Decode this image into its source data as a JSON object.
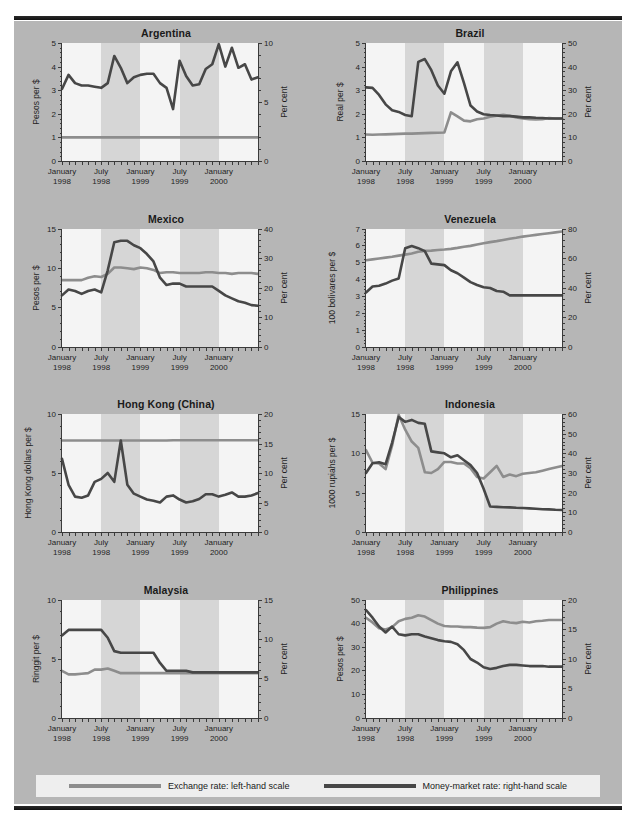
{
  "legend": {
    "exchange": {
      "label": "Exchange rate: left-hand scale",
      "color": "#8d8d8d"
    },
    "money": {
      "label": "Money-market rate: right-hand scale",
      "color": "#474747"
    }
  },
  "x_axis": {
    "tick_labels": [
      {
        "line1": "January",
        "line2": "1998",
        "pos": 0.0
      },
      {
        "line1": "July",
        "line2": "1998",
        "pos": 0.2
      },
      {
        "line1": "January",
        "line2": "1999",
        "pos": 0.4
      },
      {
        "line1": "July",
        "line2": "1999",
        "pos": 0.6
      },
      {
        "line1": "January",
        "line2": "2000",
        "pos": 0.8
      }
    ],
    "minor_ticks": 30,
    "shaded_bands": [
      [
        0.2,
        0.4
      ],
      [
        0.6,
        0.8
      ]
    ],
    "range": "January 1998 - July 2000"
  },
  "chart_data": [
    {
      "type": "line",
      "title": "Argentina",
      "ylabel": "Pesos per $",
      "ylabel_right": "Per cent",
      "ylim": [
        0,
        5
      ],
      "yticks": [
        0,
        1,
        2,
        3,
        4,
        5
      ],
      "ylim_right": [
        0,
        10
      ],
      "yticks_right": [
        0,
        5,
        10
      ],
      "x": [
        "Jan-98",
        "Feb-98",
        "Mar-98",
        "Apr-98",
        "May-98",
        "Jun-98",
        "Jul-98",
        "Aug-98",
        "Sep-98",
        "Oct-98",
        "Nov-98",
        "Dec-98",
        "Jan-99",
        "Feb-99",
        "Mar-99",
        "Apr-99",
        "May-99",
        "Jun-99",
        "Jul-99",
        "Aug-99",
        "Sep-99",
        "Oct-99",
        "Nov-99",
        "Dec-99",
        "Jan-00",
        "Feb-00",
        "Mar-00",
        "Apr-00",
        "May-00",
        "Jun-00",
        "Jul-00"
      ],
      "series": [
        {
          "name": "Exchange rate",
          "scale": "left",
          "values": [
            1,
            1,
            1,
            1,
            1,
            1,
            1,
            1,
            1,
            1,
            1,
            1,
            1,
            1,
            1,
            1,
            1,
            1,
            1,
            1,
            1,
            1,
            1,
            1,
            1,
            1,
            1,
            1,
            1,
            1,
            1
          ]
        },
        {
          "name": "Money-market rate",
          "scale": "right",
          "values": [
            6.1,
            7.3,
            6.6,
            6.4,
            6.4,
            6.3,
            6.2,
            6.6,
            8.9,
            7.9,
            6.6,
            7.1,
            7.3,
            7.4,
            7.4,
            6.6,
            6.2,
            4.4,
            8.5,
            7.2,
            6.4,
            6.5,
            7.8,
            8.2,
            9.9,
            8.0,
            9.6,
            7.9,
            8.2,
            6.9,
            7.1
          ]
        }
      ]
    },
    {
      "type": "line",
      "title": "Brazil",
      "ylabel": "Real per $",
      "ylabel_right": "Per cent",
      "ylim": [
        0,
        5
      ],
      "yticks": [
        0,
        1,
        2,
        3,
        4,
        5
      ],
      "ylim_right": [
        0,
        50
      ],
      "yticks_right": [
        0,
        10,
        20,
        30,
        40,
        50
      ],
      "x": [
        "Jan-98",
        "Feb-98",
        "Mar-98",
        "Apr-98",
        "May-98",
        "Jun-98",
        "Jul-98",
        "Aug-98",
        "Sep-98",
        "Oct-98",
        "Nov-98",
        "Dec-98",
        "Jan-99",
        "Feb-99",
        "Mar-99",
        "Apr-99",
        "May-99",
        "Jun-99",
        "Jul-99",
        "Aug-99",
        "Sep-99",
        "Oct-99",
        "Nov-99",
        "Dec-99",
        "Jan-00",
        "Feb-00",
        "Mar-00",
        "Apr-00",
        "May-00",
        "Jun-00",
        "Jul-00"
      ],
      "series": [
        {
          "name": "Exchange rate",
          "scale": "left",
          "values": [
            1.12,
            1.11,
            1.12,
            1.13,
            1.14,
            1.15,
            1.16,
            1.16,
            1.17,
            1.18,
            1.19,
            1.2,
            1.21,
            2.06,
            1.89,
            1.71,
            1.68,
            1.77,
            1.8,
            1.88,
            1.92,
            1.96,
            1.92,
            1.84,
            1.8,
            1.77,
            1.76,
            1.77,
            1.82,
            1.8,
            1.8
          ]
        },
        {
          "name": "Money-market rate",
          "scale": "right",
          "values": [
            31.2,
            31.0,
            28.0,
            24.0,
            21.5,
            20.8,
            19.5,
            19.0,
            42.0,
            43.2,
            38.5,
            32.0,
            28.5,
            38.0,
            41.8,
            33.0,
            23.5,
            21.0,
            19.8,
            19.5,
            19.3,
            19.0,
            19.0,
            18.8,
            18.5,
            18.5,
            18.3,
            18.2,
            18.0,
            18.0,
            18.0
          ]
        }
      ]
    },
    {
      "type": "line",
      "title": "Mexico",
      "ylabel": "Pesos per $",
      "ylabel_right": "Per cent",
      "ylim": [
        0,
        15
      ],
      "yticks": [
        0,
        5,
        10,
        15
      ],
      "ylim_right": [
        0,
        40
      ],
      "yticks_right": [
        0,
        10,
        20,
        30,
        40
      ],
      "x": [
        "Jan-98",
        "Feb-98",
        "Mar-98",
        "Apr-98",
        "May-98",
        "Jun-98",
        "Jul-98",
        "Aug-98",
        "Sep-98",
        "Oct-98",
        "Nov-98",
        "Dec-98",
        "Jan-99",
        "Feb-99",
        "Mar-99",
        "Apr-99",
        "May-99",
        "Jun-99",
        "Jul-99",
        "Aug-99",
        "Sep-99",
        "Oct-99",
        "Nov-99",
        "Dec-99",
        "Jan-00",
        "Feb-00",
        "Mar-00",
        "Apr-00",
        "May-00",
        "Jun-00",
        "Jul-00"
      ],
      "series": [
        {
          "name": "Exchange rate",
          "scale": "left",
          "values": [
            8.5,
            8.5,
            8.5,
            8.5,
            8.8,
            9.0,
            8.9,
            9.3,
            10.1,
            10.1,
            10.0,
            9.9,
            10.1,
            10.0,
            9.8,
            9.4,
            9.5,
            9.5,
            9.4,
            9.4,
            9.4,
            9.4,
            9.5,
            9.5,
            9.4,
            9.4,
            9.3,
            9.4,
            9.4,
            9.4,
            9.3
          ]
        },
        {
          "name": "Money-market rate",
          "scale": "right",
          "values": [
            17.5,
            19.5,
            19.0,
            18.0,
            19.0,
            19.5,
            18.5,
            26.0,
            35.5,
            36.0,
            36.0,
            34.5,
            33.5,
            31.5,
            29.0,
            23.5,
            21.0,
            21.5,
            21.5,
            20.5,
            20.5,
            20.5,
            20.5,
            20.5,
            19.0,
            17.5,
            16.5,
            15.5,
            15.0,
            14.2,
            14.0
          ]
        }
      ]
    },
    {
      "type": "line",
      "title": "Venezuela",
      "ylabel": "100 bolivares per $",
      "ylabel_right": "Per cent",
      "ylim": [
        0,
        7
      ],
      "yticks": [
        0,
        1,
        2,
        3,
        4,
        5,
        6,
        7
      ],
      "ylim_right": [
        0,
        80
      ],
      "yticks_right": [
        0,
        20,
        40,
        60,
        80
      ],
      "x": [
        "Jan-98",
        "Feb-98",
        "Mar-98",
        "Apr-98",
        "May-98",
        "Jun-98",
        "Jul-98",
        "Aug-98",
        "Sep-98",
        "Oct-98",
        "Nov-98",
        "Dec-98",
        "Jan-99",
        "Feb-99",
        "Mar-99",
        "Apr-99",
        "May-99",
        "Jun-99",
        "Jul-99",
        "Aug-99",
        "Sep-99",
        "Oct-99",
        "Nov-99",
        "Dec-99",
        "Jan-00",
        "Feb-00",
        "Mar-00",
        "Apr-00",
        "May-00",
        "Jun-00",
        "Jul-00"
      ],
      "series": [
        {
          "name": "Exchange rate",
          "scale": "left",
          "values": [
            5.15,
            5.2,
            5.25,
            5.3,
            5.35,
            5.42,
            5.48,
            5.55,
            5.65,
            5.7,
            5.72,
            5.75,
            5.78,
            5.82,
            5.88,
            5.95,
            6.0,
            6.08,
            6.15,
            6.22,
            6.28,
            6.35,
            6.42,
            6.48,
            6.55,
            6.6,
            6.65,
            6.7,
            6.75,
            6.8,
            6.85
          ]
        },
        {
          "name": "Money-market rate",
          "scale": "right",
          "values": [
            37.0,
            41.0,
            41.5,
            43.0,
            45.0,
            46.5,
            67.0,
            68.5,
            67.0,
            65.0,
            56.5,
            56.0,
            55.5,
            52.0,
            50.0,
            47.0,
            44.0,
            42.0,
            40.5,
            40.0,
            38.0,
            37.5,
            35.0,
            35.0,
            35.0,
            35.0,
            35.0,
            35.0,
            35.0,
            35.0,
            35.0
          ]
        }
      ]
    },
    {
      "type": "line",
      "title": "Hong Kong (China)",
      "ylabel": "Hong Kong dollars per $",
      "ylabel_right": "Per cent",
      "ylim": [
        0,
        10
      ],
      "yticks": [
        0,
        5,
        10
      ],
      "ylim_right": [
        0,
        20
      ],
      "yticks_right": [
        0,
        5,
        10,
        15,
        20
      ],
      "x": [
        "Jan-98",
        "Feb-98",
        "Mar-98",
        "Apr-98",
        "May-98",
        "Jun-98",
        "Jul-98",
        "Aug-98",
        "Sep-98",
        "Oct-98",
        "Nov-98",
        "Dec-98",
        "Jan-99",
        "Feb-99",
        "Mar-99",
        "Apr-99",
        "May-99",
        "Jun-99",
        "Jul-99",
        "Aug-99",
        "Sep-99",
        "Oct-99",
        "Nov-99",
        "Dec-99",
        "Jan-00",
        "Feb-00",
        "Mar-00",
        "Apr-00",
        "May-00",
        "Jun-00",
        "Jul-00"
      ],
      "series": [
        {
          "name": "Exchange rate",
          "scale": "left",
          "values": [
            7.75,
            7.75,
            7.75,
            7.75,
            7.75,
            7.75,
            7.75,
            7.75,
            7.75,
            7.75,
            7.75,
            7.75,
            7.75,
            7.75,
            7.75,
            7.75,
            7.75,
            7.78,
            7.78,
            7.78,
            7.78,
            7.78,
            7.78,
            7.78,
            7.78,
            7.78,
            7.78,
            7.78,
            7.78,
            7.78,
            7.78
          ]
        },
        {
          "name": "Money-market rate",
          "scale": "right",
          "values": [
            12.4,
            8.0,
            6.0,
            5.8,
            6.2,
            8.5,
            9.0,
            10.0,
            8.5,
            15.5,
            8.0,
            6.5,
            6.0,
            5.5,
            5.3,
            5.0,
            6.0,
            6.2,
            5.5,
            5.0,
            5.2,
            5.6,
            6.4,
            6.4,
            6.0,
            6.3,
            6.7,
            6.0,
            6.0,
            6.2,
            6.6
          ]
        }
      ]
    },
    {
      "type": "line",
      "title": "Indonesia",
      "ylabel": "1000 rupiahs per $",
      "ylabel_right": "Per cent",
      "ylim": [
        0,
        15
      ],
      "yticks": [
        0,
        5,
        10,
        15
      ],
      "ylim_right": [
        0,
        60
      ],
      "yticks_right": [
        0,
        10,
        20,
        30,
        40,
        50,
        60
      ],
      "x": [
        "Jan-98",
        "Feb-98",
        "Mar-98",
        "Apr-98",
        "May-98",
        "Jun-98",
        "Jul-98",
        "Aug-98",
        "Sep-98",
        "Oct-98",
        "Nov-98",
        "Dec-98",
        "Jan-99",
        "Feb-99",
        "Mar-99",
        "Apr-99",
        "May-99",
        "Jun-99",
        "Jul-99",
        "Aug-99",
        "Sep-99",
        "Oct-99",
        "Nov-99",
        "Dec-99",
        "Jan-00",
        "Feb-00",
        "Mar-00",
        "Apr-00",
        "May-00",
        "Jun-00",
        "Jul-00"
      ],
      "series": [
        {
          "name": "Exchange rate",
          "scale": "left",
          "values": [
            10.4,
            8.8,
            8.7,
            8.0,
            11.0,
            14.9,
            13.0,
            11.5,
            10.7,
            7.6,
            7.5,
            8.0,
            8.9,
            8.9,
            8.7,
            8.7,
            8.1,
            7.0,
            6.8,
            7.6,
            8.4,
            7.0,
            7.3,
            7.1,
            7.4,
            7.5,
            7.6,
            7.8,
            8.0,
            8.2,
            8.4
          ]
        },
        {
          "name": "Money-market rate",
          "scale": "right",
          "values": [
            30.0,
            35.0,
            35.5,
            34.5,
            45.5,
            58.5,
            56.0,
            57.0,
            55.5,
            55.0,
            41.0,
            40.5,
            40.0,
            38.0,
            39.0,
            36.5,
            34.0,
            30.0,
            22.0,
            13.0,
            12.8,
            12.6,
            12.5,
            12.3,
            12.2,
            12.0,
            11.8,
            11.6,
            11.5,
            11.3,
            11.2
          ]
        }
      ]
    },
    {
      "type": "line",
      "title": "Malaysia",
      "ylabel": "Ringgit per $",
      "ylabel_right": "Per cent",
      "ylim": [
        0,
        10
      ],
      "yticks": [
        0,
        5,
        10
      ],
      "ylim_right": [
        0,
        15
      ],
      "yticks_right": [
        0,
        5,
        10,
        15
      ],
      "x": [
        "Jan-98",
        "Feb-98",
        "Mar-98",
        "Apr-98",
        "May-98",
        "Jun-98",
        "Jul-98",
        "Aug-98",
        "Sep-98",
        "Oct-98",
        "Nov-98",
        "Dec-98",
        "Jan-99",
        "Feb-99",
        "Mar-99",
        "Apr-99",
        "May-99",
        "Jun-99",
        "Jul-99",
        "Aug-99",
        "Sep-99",
        "Oct-99",
        "Nov-99",
        "Dec-99",
        "Jan-00",
        "Feb-00",
        "Mar-00",
        "Apr-00",
        "May-00",
        "Jun-00",
        "Jul-00"
      ],
      "series": [
        {
          "name": "Exchange rate",
          "scale": "left",
          "values": [
            4.0,
            3.7,
            3.7,
            3.75,
            3.8,
            4.1,
            4.1,
            4.2,
            4.0,
            3.8,
            3.8,
            3.8,
            3.8,
            3.8,
            3.8,
            3.8,
            3.8,
            3.8,
            3.8,
            3.8,
            3.8,
            3.8,
            3.8,
            3.8,
            3.8,
            3.8,
            3.8,
            3.8,
            3.8,
            3.8,
            3.8
          ]
        },
        {
          "name": "Money-market rate",
          "scale": "right",
          "values": [
            10.5,
            11.2,
            11.2,
            11.2,
            11.2,
            11.2,
            11.2,
            10.2,
            8.5,
            8.3,
            8.3,
            8.3,
            8.3,
            8.3,
            8.3,
            7.0,
            6.0,
            6.0,
            6.0,
            6.0,
            5.8,
            5.8,
            5.8,
            5.8,
            5.8,
            5.8,
            5.8,
            5.8,
            5.8,
            5.8,
            5.8
          ]
        }
      ]
    },
    {
      "type": "line",
      "title": "Philippines",
      "ylabel": "Pesos per $",
      "ylabel_right": "Per cent",
      "ylim": [
        0,
        50
      ],
      "yticks": [
        0,
        10,
        20,
        30,
        40,
        50
      ],
      "ylim_right": [
        0,
        20
      ],
      "yticks_right": [
        0,
        5,
        10,
        15,
        20
      ],
      "x": [
        "Jan-98",
        "Feb-98",
        "Mar-98",
        "Apr-98",
        "May-98",
        "Jun-98",
        "Jul-98",
        "Aug-98",
        "Sep-98",
        "Oct-98",
        "Nov-98",
        "Dec-98",
        "Jan-99",
        "Feb-99",
        "Mar-99",
        "Apr-99",
        "May-99",
        "Jun-99",
        "Jul-99",
        "Aug-99",
        "Sep-99",
        "Oct-99",
        "Nov-99",
        "Dec-99",
        "Jan-00",
        "Feb-00",
        "Mar-00",
        "Apr-00",
        "May-00",
        "Jun-00",
        "Jul-00"
      ],
      "series": [
        {
          "name": "Exchange rate",
          "scale": "left",
          "values": [
            42.5,
            40.5,
            38.0,
            37.5,
            38.5,
            41.0,
            42.0,
            42.5,
            43.5,
            43.0,
            41.5,
            40.0,
            39.0,
            38.8,
            38.8,
            38.5,
            38.5,
            38.3,
            38.2,
            38.5,
            40.0,
            41.0,
            40.5,
            40.2,
            40.8,
            40.5,
            41.0,
            41.2,
            41.5,
            41.5,
            41.5
          ]
        },
        {
          "name": "Money-market rate",
          "scale": "right",
          "values": [
            18.3,
            17.0,
            15.5,
            14.5,
            15.5,
            14.2,
            14.0,
            14.2,
            14.2,
            13.8,
            13.5,
            13.2,
            13.0,
            12.9,
            12.5,
            11.5,
            10.0,
            9.4,
            8.6,
            8.3,
            8.5,
            8.8,
            9.0,
            9.0,
            8.9,
            8.8,
            8.8,
            8.8,
            8.7,
            8.7,
            8.7
          ]
        }
      ]
    }
  ]
}
